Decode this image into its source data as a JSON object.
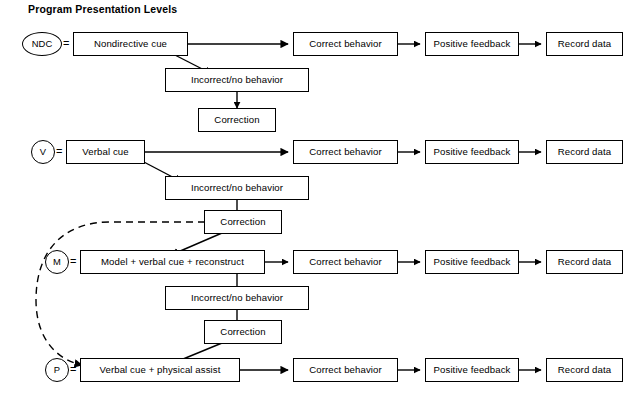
{
  "title": "Program Presentation Levels",
  "labels": {
    "correct_behavior": "Correct behavior",
    "positive_feedback": "Positive feedback",
    "record_data": "Record data",
    "incorrect_behavior": "Incorrect/no behavior",
    "correction": "Correction",
    "equals": "="
  },
  "levels": [
    {
      "code": "NDC",
      "code_shape": "ellipse",
      "cue": "Nondirective cue",
      "chain": [
        "Correct behavior",
        "Positive feedback",
        "Record data"
      ],
      "failure": "Incorrect/no behavior",
      "correction": "Correction"
    },
    {
      "code": "V",
      "code_shape": "circle",
      "cue": "Verbal cue",
      "chain": [
        "Correct behavior",
        "Positive feedback",
        "Record data"
      ],
      "failure": "Incorrect/no behavior",
      "correction": "Correction"
    },
    {
      "code": "M",
      "code_shape": "circle",
      "cue": "Model  +  verbal cue  +  reconstruct",
      "chain": [
        "Correct behavior",
        "Positive feedback",
        "Record data"
      ],
      "failure": "Incorrect/no behavior",
      "correction": "Correction"
    },
    {
      "code": "P",
      "code_shape": "circle",
      "cue": "Verbal cue  +  physical assist",
      "chain": [
        "Correct behavior",
        "Positive feedback",
        "Record data"
      ],
      "failure": null,
      "correction": null
    }
  ],
  "connectors": {
    "solid_arrow_style": "solid-black-arrow",
    "dashed_bypass": "dashed-curved-bypass-from-verbal-correction-to-physical-assist",
    "stroke_color": "#000000"
  }
}
